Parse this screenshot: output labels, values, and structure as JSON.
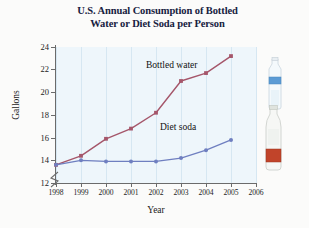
{
  "chart_data": {
    "type": "line",
    "title": "U.S. Annual Consumption of Bottled Water or Diet Soda per Person",
    "title_line1": "U.S. Annual Consumption of Bottled",
    "title_line2": "Water or Diet Soda per Person",
    "xlabel": "Year",
    "ylabel": "Gallons",
    "x": [
      1998,
      1999,
      2000,
      2001,
      2002,
      2003,
      2004,
      2005
    ],
    "xticks": [
      "1998",
      "1999",
      "2000",
      "2001",
      "2002",
      "2003",
      "2004",
      "2005",
      "2006"
    ],
    "yticks": [
      "12",
      "14",
      "16",
      "18",
      "20",
      "22",
      "24"
    ],
    "xlim": [
      1998,
      2006
    ],
    "ylim": [
      12,
      24
    ],
    "y_axis_broken": true,
    "grid": "vertical",
    "legend_position": "inline-labels",
    "series": [
      {
        "name": "Bottled water",
        "color": "#a5566a",
        "marker": "square",
        "values": [
          13.6,
          14.4,
          15.9,
          16.8,
          18.2,
          21.0,
          21.7,
          23.2
        ]
      },
      {
        "name": "Diet soda",
        "color": "#6f7fc0",
        "marker": "circle",
        "values": [
          13.6,
          14.0,
          13.9,
          13.9,
          13.9,
          14.2,
          14.9,
          15.8
        ]
      }
    ],
    "annotations": [
      {
        "name": "bottled-water-label",
        "text": "Bottled water"
      },
      {
        "name": "diet-soda-label",
        "text": "Diet soda"
      }
    ],
    "illustrations": [
      {
        "name": "water-bottle-image",
        "label_color": "#5b9bd5"
      },
      {
        "name": "soda-bottle-image",
        "label_color": "#c1442a"
      }
    ],
    "colors": {
      "plot_background": "#eef6fb",
      "gridline": "#d6e7f2",
      "axis": "#6b6b6b",
      "title": "#16213f"
    }
  }
}
